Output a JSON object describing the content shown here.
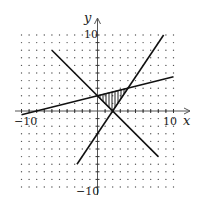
{
  "chart_data": {
    "type": "line",
    "title": "",
    "xlabel": "x",
    "ylabel": "y",
    "xlim": [
      -10,
      10
    ],
    "ylim": [
      -10,
      10
    ],
    "grid": "dots",
    "tick_labels": {
      "x_min": "-10",
      "x_max": "10",
      "y_min": "-10",
      "y_max": "10"
    },
    "series": [
      {
        "name": "line-descending",
        "equation": "y = -x + 2",
        "points": [
          [
            -6,
            8
          ],
          [
            0,
            2
          ],
          [
            2,
            0
          ],
          [
            8,
            -6
          ]
        ]
      },
      {
        "name": "line-steep",
        "equation": "y = 1.5x - 3",
        "points": [
          [
            -2.7,
            -7
          ],
          [
            0,
            -3
          ],
          [
            2,
            0
          ],
          [
            8.7,
            10
          ]
        ]
      },
      {
        "name": "line-shallow",
        "equation": "y = 0.25x + 2",
        "points": [
          [
            -10,
            -0.5
          ],
          [
            0,
            2
          ],
          [
            4,
            3
          ],
          [
            10,
            4.5
          ]
        ]
      }
    ],
    "shaded_region": {
      "type": "triangle",
      "vertices": [
        [
          0,
          2
        ],
        [
          2,
          0
        ],
        [
          4,
          3
        ]
      ],
      "pattern": "vertical-hatch"
    }
  },
  "labels": {
    "x_axis": "x",
    "y_axis": "y",
    "x_min": "−10",
    "x_max": "10",
    "y_min": "−10",
    "y_max": "10"
  }
}
